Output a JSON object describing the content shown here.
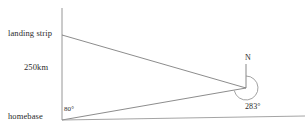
{
  "diagram": {
    "labels": {
      "landing_strip": "landing strip",
      "distance": "250km",
      "homebase": "homebase",
      "angle_at_homebase": "80°",
      "north": "N",
      "bearing_at_plane": "283°"
    },
    "colors": {
      "line": "#8a8a8a",
      "text": "#2b2b2b",
      "background": "#ffffff"
    },
    "geometry": {
      "vertical_reference_line": {
        "x": 62,
        "y_top": 8,
        "y_bottom": 120
      },
      "landing_strip_point": {
        "x": 62,
        "y": 35
      },
      "homebase_point": {
        "x": 62,
        "y": 120
      },
      "plane_point": {
        "x": 246,
        "y": 88
      },
      "baseline": {
        "x1": 62,
        "y1": 120,
        "x2": 305,
        "y2": 116
      },
      "north_line": {
        "x": 246,
        "y_top": 64,
        "y_bottom": 88
      },
      "bearing_arc_radius": 12,
      "angle_arc_radius": 22
    },
    "values": {
      "distance_km": 250,
      "angle_at_homebase_deg": 80,
      "bearing_deg": 283
    }
  }
}
